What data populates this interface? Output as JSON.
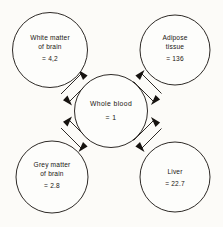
{
  "diagram": {
    "type": "radial-hub-and-spoke",
    "background_color": "#fcfbf8",
    "stroke_color": "#16120f",
    "hub": {
      "id": "whole-blood",
      "name": "Whole blood",
      "value": "= 1",
      "cx": 111,
      "cy": 111,
      "r": 36.5
    },
    "nodes": [
      {
        "id": "white-matter",
        "name_line1": "White matter",
        "name_line2": "of brain",
        "value": "= 4,2",
        "cx": 50,
        "cy": 50,
        "r": 37.5,
        "position": "top-left"
      },
      {
        "id": "adipose-tissue",
        "name_line1": "Adipose",
        "name_line2": "tissue",
        "value": "= 136",
        "cx": 175,
        "cy": 50,
        "r": 35,
        "position": "top-right"
      },
      {
        "id": "grey-matter",
        "name_line1": "Grey matter",
        "name_line2": "of brain",
        "value": "= 2.8",
        "cx": 52,
        "cy": 177,
        "r": 36,
        "position": "bottom-left"
      },
      {
        "id": "liver",
        "name_line1": "Liver",
        "name_line2": "",
        "value": "= 22.7",
        "cx": 175,
        "cy": 177,
        "r": 35,
        "position": "bottom-right"
      }
    ],
    "connectors": [
      {
        "id": "connector-white-matter",
        "from": "whole-blood",
        "to": "white-matter",
        "direction": "bidirectional",
        "style": "double-line-double-arrow"
      },
      {
        "id": "connector-adipose-tissue",
        "from": "whole-blood",
        "to": "adipose-tissue",
        "direction": "bidirectional",
        "style": "double-line-double-arrow"
      },
      {
        "id": "connector-grey-matter",
        "from": "whole-blood",
        "to": "grey-matter",
        "direction": "bidirectional",
        "style": "double-line-double-arrow"
      },
      {
        "id": "connector-liver",
        "from": "whole-blood",
        "to": "liver",
        "direction": "bidirectional",
        "style": "double-line-double-arrow"
      }
    ]
  }
}
